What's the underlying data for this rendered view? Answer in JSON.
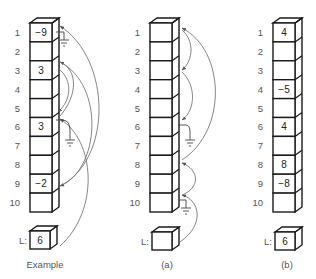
{
  "diagram": {
    "panels": [
      {
        "id": "example",
        "caption": "Example",
        "row_labels": [
          "1",
          "2",
          "3",
          "4",
          "5",
          "6",
          "7",
          "8",
          "9",
          "10"
        ],
        "cells": [
          "-9",
          "",
          "3",
          "",
          "",
          "3",
          "",
          "",
          "-2",
          ""
        ],
        "L_label": "L:",
        "L_value": "6",
        "links": [
          {
            "from": "L",
            "to": 6
          },
          {
            "from": 6,
            "to": 3
          },
          {
            "from": 3,
            "to": 9
          },
          {
            "from": 9,
            "to": 1
          },
          {
            "from": 1,
            "to": "ground"
          },
          {
            "from": 6,
            "to": "ground-alt"
          }
        ]
      },
      {
        "id": "a",
        "caption": "(a)",
        "row_labels": [
          "1",
          "2",
          "3",
          "4",
          "5",
          "6",
          "7",
          "8",
          "9",
          "10"
        ],
        "cells": [
          "",
          "",
          "",
          "",
          "",
          "",
          "",
          "",
          "",
          ""
        ],
        "L_label": "L:",
        "L_value": "",
        "links": [
          {
            "from": "L",
            "to": 10
          },
          {
            "from": 10,
            "to": 8
          },
          {
            "from": 8,
            "to": 1
          },
          {
            "from": 1,
            "to": 3
          },
          {
            "from": 3,
            "to": 6
          },
          {
            "from": 6,
            "to": "ground"
          },
          {
            "from": 10,
            "to": "ground"
          }
        ]
      },
      {
        "id": "b",
        "caption": "(b)",
        "row_labels": [
          "1",
          "2",
          "3",
          "4",
          "5",
          "6",
          "7",
          "8",
          "9",
          "10"
        ],
        "cells": [
          "4",
          "",
          "",
          "-5",
          "",
          "4",
          "",
          "8",
          "-8",
          ""
        ],
        "L_label": "L:",
        "L_value": "6",
        "links": []
      }
    ]
  }
}
